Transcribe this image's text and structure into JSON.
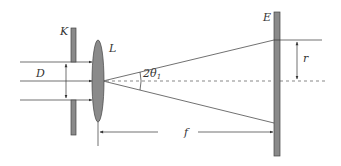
{
  "diagram": {
    "labels": {
      "aperture": "K",
      "lens": "L",
      "screen": "E",
      "beam_diameter": "D",
      "angle": "2θ",
      "angle_sub": "1",
      "radius": "r",
      "focal_length": "f"
    },
    "colors": {
      "plate_fill": "#8a8a8a",
      "plate_stroke": "#444444",
      "line": "#333333"
    }
  }
}
